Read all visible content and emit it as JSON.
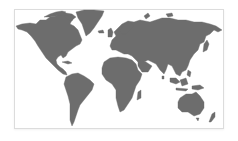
{
  "map": {
    "title": "World map",
    "projection": "equirectangular-like",
    "style": "grayscale silhouette",
    "colors": {
      "land": "#6d6d6d",
      "water": "#ffffff",
      "frame": "#dcdcdc"
    },
    "regions": [
      {
        "id": "north-america",
        "label": "North America"
      },
      {
        "id": "greenland",
        "label": "Greenland"
      },
      {
        "id": "south-america",
        "label": "South America"
      },
      {
        "id": "europe-asia",
        "label": "Eurasia"
      },
      {
        "id": "africa",
        "label": "Africa"
      },
      {
        "id": "australia",
        "label": "Australia"
      },
      {
        "id": "islands",
        "label": "Islands"
      }
    ]
  }
}
